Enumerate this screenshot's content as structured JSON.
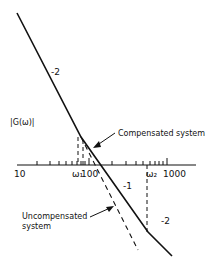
{
  "diagram": {
    "type": "bode-magnitude-asymptotic-plot",
    "y_axis_label": "|G(ω)|",
    "x_axis": {
      "scale": "log",
      "tick_labels": {
        "t10": "10",
        "t100": "100",
        "t1000": "1000",
        "w1": "ω₁",
        "w2": "ω₂"
      }
    },
    "slope_labels": {
      "top": "-2",
      "middle": "-1",
      "bottom": "-2"
    },
    "annotations": {
      "compensated": "Compensated system",
      "uncompensated_line1": "Uncompensated",
      "uncompensated_line2": "system"
    },
    "colors": {
      "line": "#111111",
      "background": "#ffffff"
    }
  }
}
